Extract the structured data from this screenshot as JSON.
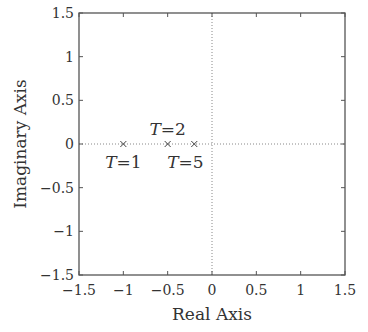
{
  "chart_data": {
    "type": "scatter",
    "title": "",
    "xlabel": "Real Axis",
    "ylabel": "Imaginary Axis",
    "xlim": [
      -1.5,
      1.5
    ],
    "ylim": [
      -1.5,
      1.5
    ],
    "xticks": [
      "−1.5",
      "−1",
      "−0.5",
      "0",
      "0.5",
      "1",
      "1.5"
    ],
    "yticks": [
      "1.5",
      "1",
      "0.5",
      "0",
      "−0.5",
      "−1",
      "−1.5"
    ],
    "grid": false,
    "marker": "x",
    "series": [
      {
        "name": "poles",
        "points": [
          {
            "x": -1.0,
            "y": 0,
            "label": "T=1"
          },
          {
            "x": -0.5,
            "y": 0,
            "label": "T=2"
          },
          {
            "x": -0.2,
            "y": 0,
            "label": "T=5"
          }
        ]
      }
    ],
    "annotations": [
      {
        "text": "T=1",
        "position": "below",
        "x": -1.0
      },
      {
        "text": "T=2",
        "position": "above",
        "x": -0.5
      },
      {
        "text": "T=5",
        "position": "below",
        "x": -0.3
      }
    ],
    "reference_lines": [
      "x=0 dotted",
      "y=0 dotted"
    ]
  }
}
